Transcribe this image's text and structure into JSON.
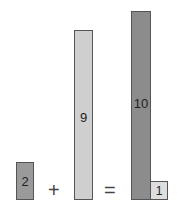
{
  "equation": {
    "addend1": {
      "label": "2",
      "color": "#9a9a9a"
    },
    "plus": "+",
    "addend2": {
      "label": "9",
      "color": "#cfcfcf"
    },
    "equals": "=",
    "result_tens": {
      "label": "10",
      "color": "#8c8c8c"
    },
    "result_ones": {
      "label": "1",
      "color": "#dedede"
    }
  }
}
